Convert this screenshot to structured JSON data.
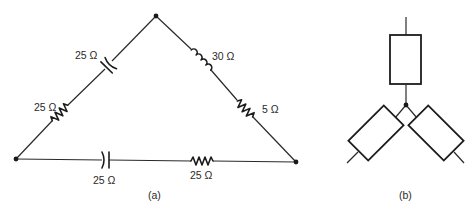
{
  "figure": {
    "panel_a": {
      "caption": "(a)",
      "nodes": [
        "top",
        "bottom-left",
        "bottom-right"
      ],
      "left_branch": {
        "capacitor": {
          "type": "capacitor",
          "label": "25 Ω"
        },
        "resistor": {
          "type": "resistor",
          "label": "25 Ω"
        }
      },
      "right_branch": {
        "inductor": {
          "type": "inductor",
          "label": "30 Ω"
        },
        "resistor": {
          "type": "resistor",
          "label": "5 Ω"
        }
      },
      "bottom_branch": {
        "capacitor": {
          "type": "capacitor",
          "label": "25 Ω"
        },
        "resistor": {
          "type": "resistor",
          "label": "25 Ω"
        }
      }
    },
    "panel_b": {
      "caption": "(b)",
      "description": "Y (star) connection of three generic impedances",
      "impedances": [
        "top",
        "lower-left",
        "lower-right"
      ]
    }
  }
}
